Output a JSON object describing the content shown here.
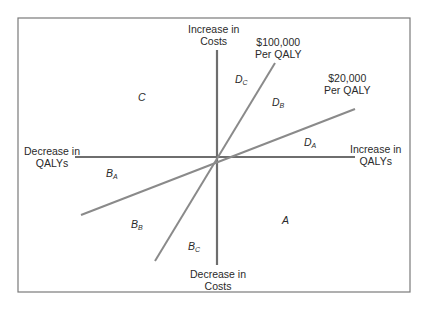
{
  "diagram": {
    "type": "cost-effectiveness-plane",
    "colors": {
      "axis": "#6e6e6e",
      "threshold": "#8a8a8a",
      "border": "#7a7a7a",
      "text": "#2a2a2a"
    },
    "axes": {
      "top": {
        "line1": "Increase in",
        "line2": "Costs"
      },
      "bottom": {
        "line1": "Decrease in",
        "line2": "Costs"
      },
      "left": {
        "line1": "Decrease in",
        "line2": "QALYs"
      },
      "right": {
        "line1": "Increase in",
        "line2": "QALYs"
      }
    },
    "thresholds": [
      {
        "line1": "$100,000",
        "line2": "Per QALY"
      },
      {
        "line1": "$20,000",
        "line2": "Per QALY"
      }
    ],
    "regions": {
      "A": {
        "main": "A",
        "sub": ""
      },
      "C": {
        "main": "C",
        "sub": ""
      },
      "DA": {
        "main": "D",
        "sub": "A"
      },
      "DB": {
        "main": "D",
        "sub": "B"
      },
      "DC": {
        "main": "D",
        "sub": "C"
      },
      "BA": {
        "main": "B",
        "sub": "A"
      },
      "BB": {
        "main": "B",
        "sub": "B"
      },
      "BC": {
        "main": "B",
        "sub": "C"
      }
    }
  }
}
